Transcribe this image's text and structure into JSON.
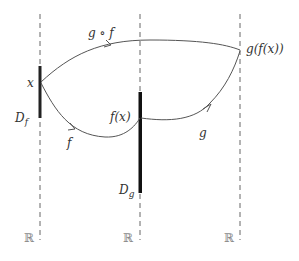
{
  "diagram": {
    "axes": [
      {
        "id": "left",
        "label": "ℝ"
      },
      {
        "id": "middle",
        "label": "ℝ"
      },
      {
        "id": "right",
        "label": "ℝ"
      }
    ],
    "domains": {
      "f": {
        "base": "D",
        "sub": "f"
      },
      "g": {
        "base": "D",
        "sub": "g"
      }
    },
    "points": {
      "x": "x",
      "fx": "f(x)",
      "gfx": "g(f(x))"
    },
    "arrows": {
      "f": "f",
      "g": "g",
      "composition": "g ∘ f"
    },
    "colors": {
      "line": "#555555",
      "bar": "#111111",
      "dash": "#666666"
    }
  }
}
